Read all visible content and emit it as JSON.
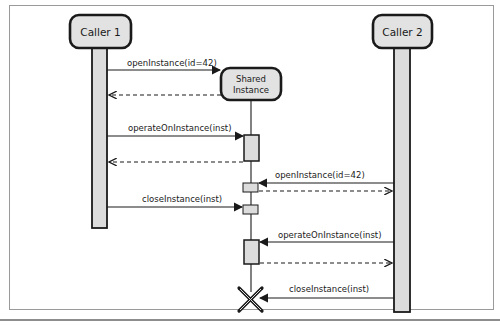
{
  "participants": [
    {
      "id": "caller1",
      "label": "Caller 1"
    },
    {
      "id": "shared",
      "label_line1": "Shared",
      "label_line2": "Instance"
    },
    {
      "id": "caller2",
      "label": "Caller 2"
    }
  ],
  "messages": [
    {
      "from": "caller1",
      "to": "shared",
      "label": "openInstance(id=42)",
      "type": "call"
    },
    {
      "from": "shared",
      "to": "caller1",
      "label": "",
      "type": "return"
    },
    {
      "from": "caller1",
      "to": "shared",
      "label": "operateOnInstance(inst)",
      "type": "call"
    },
    {
      "from": "shared",
      "to": "caller1",
      "label": "",
      "type": "return"
    },
    {
      "from": "caller2",
      "to": "shared",
      "label": "openInstance(id=42)",
      "type": "call"
    },
    {
      "from": "shared",
      "to": "caller2",
      "label": "",
      "type": "return"
    },
    {
      "from": "caller1",
      "to": "shared",
      "label": "closeInstance(inst)",
      "type": "call"
    },
    {
      "from": "caller2",
      "to": "shared",
      "label": "operateOnInstance(inst)",
      "type": "call"
    },
    {
      "from": "shared",
      "to": "caller2",
      "label": "",
      "type": "return"
    },
    {
      "from": "caller2",
      "to": "shared",
      "label": "closeInstance(inst)",
      "type": "call"
    }
  ],
  "colors": {
    "box_fill": "#e2e2e2",
    "stroke": "#1a1a1a",
    "lifeline_fill": "#dcdcdc"
  }
}
